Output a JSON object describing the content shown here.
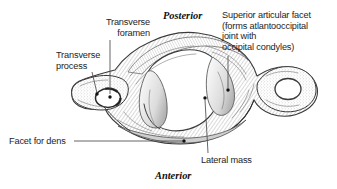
{
  "figure": {
    "background_color": "#ffffff",
    "ink_color": "#1d1d1d",
    "leader_color": "#4a4a4a"
  },
  "orientation": {
    "posterior": "Posterior",
    "anterior": "Anterior"
  },
  "labels": {
    "transverse_foramen": "Transverse\nforamen",
    "transverse_process": "Transverse\nprocess",
    "superior_articular_facet": "Superior articular facet\n(forms atlantooccipital\njoint with\noccipital condyles)",
    "facet_for_dens": "Facet for dens",
    "lateral_mass": "Lateral mass"
  }
}
